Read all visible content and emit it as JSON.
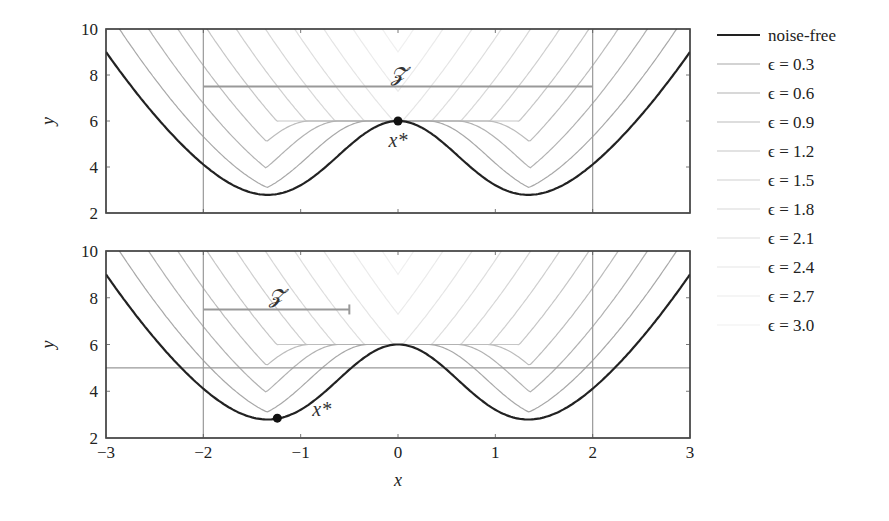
{
  "chart_data": [
    {
      "type": "line",
      "panel": "top",
      "title": "",
      "xlabel": "",
      "ylabel": "y",
      "xlim": [
        -3,
        3
      ],
      "ylim": [
        2,
        10
      ],
      "yticks": [
        2,
        4,
        6,
        8,
        10
      ],
      "xticks": [
        -3,
        -2,
        -1,
        0,
        1,
        2,
        3
      ],
      "show_xtick_labels": false,
      "grid": false,
      "function": "f(x) = x^2 + 6*exp(-x^2); noisy curves = max over |d|<=eps of f(x+d)",
      "series": [
        {
          "name": "noise-free",
          "eps": 0.0
        },
        {
          "name": "ε = 0.3",
          "eps": 0.3
        },
        {
          "name": "ε = 0.6",
          "eps": 0.6
        },
        {
          "name": "ε = 0.9",
          "eps": 0.9
        },
        {
          "name": "ε = 1.2",
          "eps": 1.2
        },
        {
          "name": "ε = 1.5",
          "eps": 1.5
        },
        {
          "name": "ε = 1.8",
          "eps": 1.8
        },
        {
          "name": "ε = 2.1",
          "eps": 2.1
        },
        {
          "name": "ε = 2.4",
          "eps": 2.4
        },
        {
          "name": "ε = 2.7",
          "eps": 2.7
        },
        {
          "name": "ε = 3.0",
          "eps": 3.0
        }
      ],
      "sample_points_noise_free": {
        "x": [
          -3,
          -2,
          -1.34,
          -1,
          -0.5,
          0,
          0.5,
          1,
          1.34,
          2,
          3
        ],
        "y": [
          9.0,
          4.11,
          2.79,
          3.21,
          4.92,
          6.0,
          4.92,
          3.21,
          2.79,
          4.11,
          9.0
        ]
      },
      "vlines": [
        -2,
        2
      ],
      "hlines": [],
      "interval": {
        "label": "𝓩",
        "x0": -2,
        "x1": 2,
        "y": 7.5
      },
      "marker": {
        "label": "x*",
        "x": 0,
        "y": 6.0
      }
    },
    {
      "type": "line",
      "panel": "bottom",
      "title": "",
      "xlabel": "x",
      "ylabel": "y",
      "xlim": [
        -3,
        3
      ],
      "ylim": [
        2,
        10
      ],
      "yticks": [
        2,
        4,
        6,
        8,
        10
      ],
      "xticks": [
        -3,
        -2,
        -1,
        0,
        1,
        2,
        3
      ],
      "show_xtick_labels": true,
      "grid": false,
      "function": "f(x) = x^2 + 6*exp(-x^2); noisy curves = max over |d|<=eps of f(x+d)",
      "series": [
        {
          "name": "noise-free",
          "eps": 0.0
        },
        {
          "name": "ε = 0.3",
          "eps": 0.3
        },
        {
          "name": "ε = 0.6",
          "eps": 0.6
        },
        {
          "name": "ε = 0.9",
          "eps": 0.9
        },
        {
          "name": "ε = 1.2",
          "eps": 1.2
        },
        {
          "name": "ε = 1.5",
          "eps": 1.5
        },
        {
          "name": "ε = 1.8",
          "eps": 1.8
        },
        {
          "name": "ε = 2.1",
          "eps": 2.1
        },
        {
          "name": "ε = 2.4",
          "eps": 2.4
        },
        {
          "name": "ε = 2.7",
          "eps": 2.7
        },
        {
          "name": "ε = 3.0",
          "eps": 3.0
        }
      ],
      "vlines": [
        -2,
        2
      ],
      "hlines": [
        5
      ],
      "interval": {
        "label": "𝓩",
        "x0": -2,
        "x1": -0.5,
        "y": 7.5,
        "end_cap": true
      },
      "marker": {
        "label": "x*",
        "x": -1.24,
        "y": 2.85
      }
    }
  ],
  "legend": {
    "position": "right",
    "entries": [
      {
        "label": "noise-free",
        "color": "#222222",
        "width": 2.2
      },
      {
        "label": "ϵ = 0.3",
        "color": "#a8a8a8",
        "width": 1.2
      },
      {
        "label": "ϵ = 0.6",
        "color": "#b2b2b2",
        "width": 1.2
      },
      {
        "label": "ϵ = 0.9",
        "color": "#bcbcbc",
        "width": 1.2
      },
      {
        "label": "ϵ = 1.2",
        "color": "#c6c6c6",
        "width": 1.2
      },
      {
        "label": "ϵ = 1.5",
        "color": "#cfcfcf",
        "width": 1.2
      },
      {
        "label": "ϵ = 1.8",
        "color": "#d7d7d7",
        "width": 1.2
      },
      {
        "label": "ϵ = 2.1",
        "color": "#dedede",
        "width": 1.2
      },
      {
        "label": "ϵ = 2.4",
        "color": "#e5e5e5",
        "width": 1.2
      },
      {
        "label": "ϵ = 2.7",
        "color": "#ebebeb",
        "width": 1.2
      },
      {
        "label": "ϵ = 3.0",
        "color": "#f0f0f0",
        "width": 1.2
      }
    ]
  },
  "colors": {
    "frame": "#333333",
    "guide": "#999999",
    "interval": "#999999",
    "marker": "#111111"
  }
}
